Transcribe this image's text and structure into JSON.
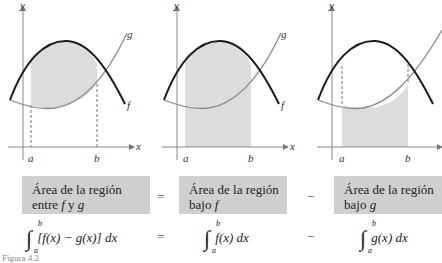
{
  "graphs": [
    {
      "id": "between",
      "shading": "between f and g",
      "labels": {
        "y": "y",
        "x": "x",
        "a": "a",
        "b": "b",
        "f": "f",
        "g": "g"
      }
    },
    {
      "id": "under_f",
      "shading": "under f",
      "labels": {
        "y": "y",
        "x": "x",
        "a": "a",
        "b": "b",
        "f": "f",
        "g": "g"
      }
    },
    {
      "id": "under_g",
      "shading": "under g",
      "labels": {
        "y": "y",
        "x": "x",
        "a": "a",
        "b": "b",
        "f": "f",
        "g": "g"
      }
    }
  ],
  "boxes": [
    {
      "line1": "Área de la región",
      "line2_prefix": "entre ",
      "line2_var1": "f",
      "line2_mid": " y ",
      "line2_var2": "g"
    },
    {
      "line1": "Área de la región",
      "line2_prefix": "bajo ",
      "line2_var1": "f"
    },
    {
      "line1": "Área de la región",
      "line2_prefix": "bajo ",
      "line2_var1": "g"
    }
  ],
  "operators": {
    "eq1": "=",
    "minus1": "−",
    "eq2": "=",
    "minus2": "−"
  },
  "formulas": {
    "f1": {
      "lower": "a",
      "upper": "b",
      "body": "[f(x) − g(x)] dx"
    },
    "f2": {
      "lower": "a",
      "upper": "b",
      "body": "f(x) dx"
    },
    "f3": {
      "lower": "a",
      "upper": "b",
      "body": "g(x) dx"
    }
  },
  "colors": {
    "shade": "#dcdcdc",
    "f_curve": "#1a1a1a",
    "g_curve": "#8a8a8a",
    "box": "#cfcfcf"
  },
  "caption": "Figura 4.2"
}
